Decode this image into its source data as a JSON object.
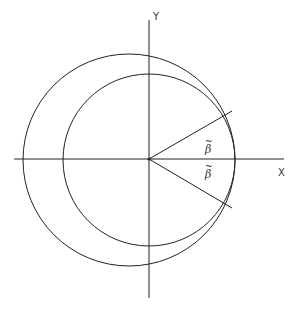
{
  "figure": {
    "axes": {
      "x_label": "X",
      "y_label": "Y"
    },
    "angle_labels": {
      "upper": {
        "symbol": "β",
        "accent": "~"
      },
      "lower": {
        "symbol": "β",
        "accent": "~"
      }
    },
    "geometry": {
      "origin": [
        149,
        159
      ],
      "outer_circle": {
        "cx": 129,
        "cy": 160,
        "r": 106
      },
      "inner_circle": {
        "cx": 149,
        "cy": 160,
        "r": 86
      },
      "upper_ray_end": [
        232,
        111
      ],
      "lower_ray_end": [
        232,
        208
      ]
    },
    "colors": {
      "line": "#222222",
      "background": "#ffffff"
    }
  }
}
